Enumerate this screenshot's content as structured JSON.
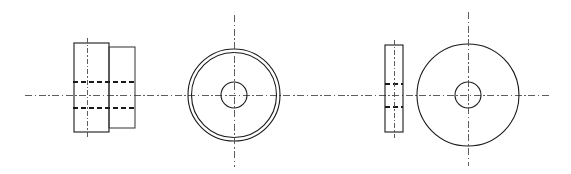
{
  "document": {
    "title": "Orthographic Engineering Drawing",
    "description": "Mechanical part drawing: two view-pairs of a cylindrical bushing / washer-like component shown in section (front) and end (side) views",
    "background_color": "#ffffff",
    "canvas": {
      "width": 571,
      "height": 174
    }
  },
  "colors": {
    "solid_line": "#1a1a1a",
    "solid_line_soft": "#3a3a3a",
    "hidden_line": "#1a1a1a",
    "center_line": "#4d4d4d",
    "paper": "#ffffff"
  },
  "line_styles": {
    "visible": "continuous thick",
    "hidden": "dashed",
    "center": "dash-dot chain"
  },
  "axes": {
    "main_horizontal_centerline": {
      "x1": 25,
      "y": 95,
      "x2": 551
    }
  },
  "views": [
    {
      "id": "view-1-front-section",
      "name": "Part A - front sectional view",
      "type": "rectangular-stepped-profile",
      "shapes": [
        {
          "shape": "rect",
          "name": "left-flange-rect",
          "x": 74,
          "y": 43,
          "width": 35,
          "height": 89
        },
        {
          "shape": "rect",
          "name": "right-body-rect",
          "x": 109,
          "y": 47,
          "width": 26,
          "height": 81
        }
      ],
      "hidden_lines": [
        {
          "name": "upper-bore-line",
          "x1": 74,
          "y": 82,
          "x2": 135
        },
        {
          "name": "lower-bore-line",
          "x1": 74,
          "y": 108,
          "x2": 135
        }
      ],
      "center_lines": [
        {
          "name": "vertical-center",
          "x": 87,
          "y1": 38,
          "y2": 138
        }
      ]
    },
    {
      "id": "view-2-end",
      "name": "Part A - end view",
      "type": "concentric-circles",
      "center": {
        "cx": 234,
        "cy": 95
      },
      "circles": [
        {
          "name": "outer-circle-outer",
          "r": 46
        },
        {
          "name": "outer-circle-inner",
          "r": 42.5
        },
        {
          "name": "bore-circle",
          "r": 13
        }
      ],
      "center_lines": [
        {
          "name": "vertical-center",
          "x": 234,
          "y1": 15,
          "y2": 167
        }
      ]
    },
    {
      "id": "view-3-front-section",
      "name": "Part B - front sectional view",
      "type": "thin-rectangular-profile",
      "shapes": [
        {
          "shape": "rect",
          "name": "disc-rect",
          "x": 385,
          "y": 45,
          "width": 18,
          "height": 87
        }
      ],
      "hidden_lines": [
        {
          "name": "upper-bore-line",
          "x1": 385,
          "y": 84,
          "x2": 403
        },
        {
          "name": "lower-bore-line",
          "x1": 385,
          "y": 107,
          "x2": 403
        }
      ],
      "center_lines": [
        {
          "name": "vertical-center",
          "x": 394,
          "y1": 40,
          "y2": 138
        }
      ]
    },
    {
      "id": "view-4-end",
      "name": "Part B - end view",
      "type": "concentric-circles",
      "center": {
        "cx": 468,
        "cy": 95
      },
      "circles": [
        {
          "name": "outer-circle",
          "r": 51
        },
        {
          "name": "bore-circle",
          "r": 13
        }
      ],
      "center_lines": [
        {
          "name": "vertical-center",
          "x": 468,
          "y1": 12,
          "y2": 166
        }
      ]
    }
  ],
  "annotations": {
    "labels": [],
    "dimensions": [],
    "notes": []
  }
}
